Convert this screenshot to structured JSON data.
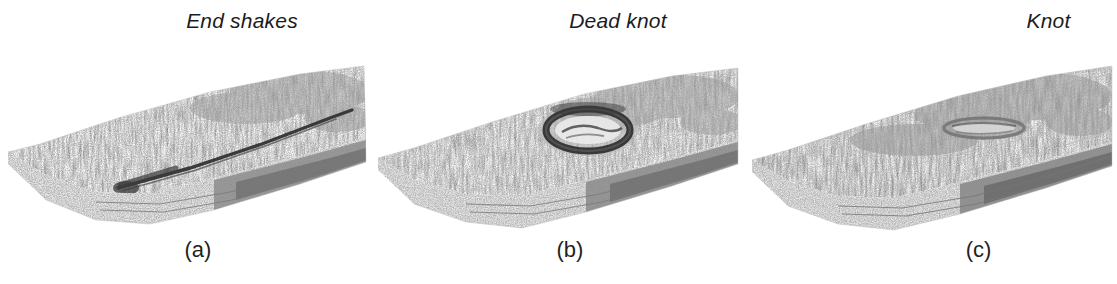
{
  "figure": {
    "background_color": "#ffffff",
    "ink_color": "#2b2b2b",
    "panel_count": 3
  },
  "panels": [
    {
      "id": "panel-a",
      "title": "End shakes",
      "caption": "(a)",
      "defect_type": "end-shake",
      "defect_description": "long dark split running diagonally across the board face"
    },
    {
      "id": "panel-b",
      "title": "Dead knot",
      "caption": "(b)",
      "defect_type": "dead-knot",
      "defect_description": "dark elliptical ring with loose core near the centre of the board face"
    },
    {
      "id": "panel-c",
      "title": "Knot",
      "caption": "(c)",
      "defect_type": "sound-knot",
      "defect_description": "flat pale elongated knot blended into the grain"
    }
  ]
}
